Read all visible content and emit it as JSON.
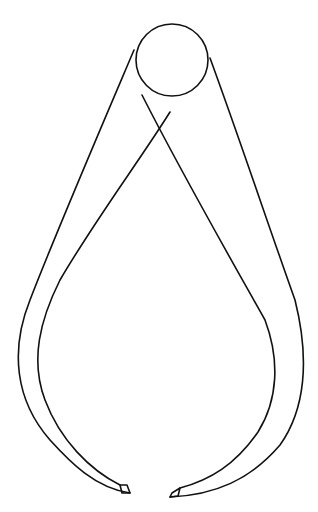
{
  "image": {
    "subject": "outside calipers line drawing",
    "background_color": "#ffffff",
    "line_color": "#111111",
    "parts": [
      "pivot-joint",
      "left-leg",
      "right-leg",
      "left-tip",
      "right-tip"
    ]
  }
}
